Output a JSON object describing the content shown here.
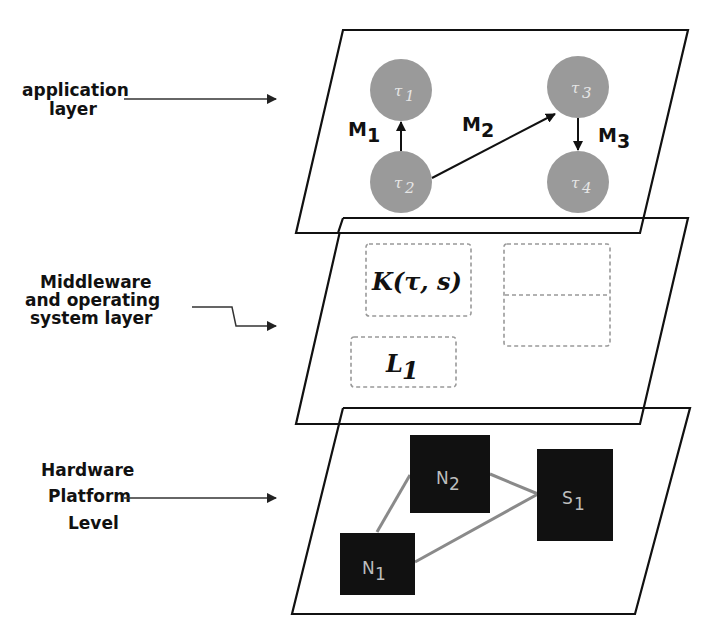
{
  "labels": {
    "application": [
      "application",
      "layer"
    ],
    "middleware": [
      "Middleware",
      "and operating",
      "system layer"
    ],
    "hardware": [
      "Hardware",
      "Platform",
      "Level"
    ]
  },
  "application_layer": {
    "tasks": [
      {
        "id": "t1",
        "label": "τ",
        "sub": "1"
      },
      {
        "id": "t2",
        "label": "τ",
        "sub": "2"
      },
      {
        "id": "t3",
        "label": "τ",
        "sub": "3"
      },
      {
        "id": "t4",
        "label": "τ",
        "sub": "4"
      }
    ],
    "messages": [
      {
        "label": "M",
        "sub": "1",
        "from": "t2",
        "to": "t1"
      },
      {
        "label": "M",
        "sub": "2",
        "from": "t2",
        "to": "t3"
      },
      {
        "label": "M",
        "sub": "3",
        "from": "t3",
        "to": "t4"
      }
    ],
    "task_color": "#9a9a9a"
  },
  "middleware_layer": {
    "boxes": [
      {
        "id": "kernel",
        "label": "K(τ, s)"
      },
      {
        "id": "lib",
        "label": "L",
        "sub": "1"
      },
      {
        "id": "empty-split",
        "label": ""
      }
    ]
  },
  "hardware_layer": {
    "nodes": [
      {
        "id": "n1",
        "label": "N",
        "sub": "1"
      },
      {
        "id": "n2",
        "label": "N",
        "sub": "2"
      },
      {
        "id": "s1",
        "label": "S",
        "sub": "1"
      }
    ],
    "links": [
      [
        "n1",
        "n2"
      ],
      [
        "n2",
        "s1"
      ],
      [
        "n1",
        "s1"
      ]
    ],
    "node_color": "#111111",
    "link_color": "#8a8a8a"
  }
}
